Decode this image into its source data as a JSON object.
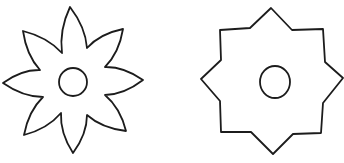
{
  "canvas": {
    "width": 344,
    "height": 163,
    "background": "#ffffff",
    "stroke": "#1c1c1c"
  },
  "shapes": [
    {
      "name": "eight-petal-flower",
      "type": "flower",
      "petals": 8,
      "center": {
        "cx": 73,
        "cy": 82,
        "r": 14
      },
      "tips": [
        [
          70,
          7
        ],
        [
          123,
          29
        ],
        [
          143,
          80
        ],
        [
          126,
          131
        ],
        [
          73,
          153
        ],
        [
          24,
          135
        ],
        [
          3,
          83
        ],
        [
          23,
          31
        ]
      ],
      "valleys": [
        [
          87,
          48
        ],
        [
          105,
          67
        ],
        [
          105,
          95
        ],
        [
          87,
          115
        ],
        [
          61,
          113
        ],
        [
          43,
          97
        ],
        [
          40,
          70
        ],
        [
          62,
          53
        ]
      ]
    },
    {
      "name": "eight-point-star",
      "type": "octagram",
      "points": 8,
      "center": {
        "cx": 275,
        "cy": 82,
        "rx": 15,
        "ry": 16
      },
      "vertices": [
        [
          271,
          8
        ],
        [
          292,
          30
        ],
        [
          323,
          29
        ],
        [
          325,
          62
        ],
        [
          343,
          78
        ],
        [
          323,
          103
        ],
        [
          321,
          133
        ],
        [
          293,
          134
        ],
        [
          273,
          154
        ],
        [
          251,
          132
        ],
        [
          221,
          132
        ],
        [
          220,
          101
        ],
        [
          201,
          79
        ],
        [
          221,
          60
        ],
        [
          220,
          30
        ],
        [
          250,
          28
        ]
      ]
    }
  ]
}
